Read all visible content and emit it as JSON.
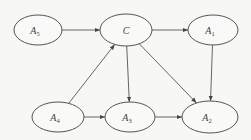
{
  "diagram": {
    "type": "directed-graph",
    "nodes": [
      {
        "id": "A5",
        "base": "A",
        "sub": "5",
        "cx": 38,
        "cy": 30,
        "rx": 24,
        "ry": 15
      },
      {
        "id": "C",
        "base": "C",
        "sub": "",
        "cx": 126,
        "cy": 30,
        "rx": 26,
        "ry": 16
      },
      {
        "id": "A1",
        "base": "A",
        "sub": "1",
        "cx": 213,
        "cy": 30,
        "rx": 25,
        "ry": 15
      },
      {
        "id": "A4",
        "base": "A",
        "sub": "4",
        "cx": 58,
        "cy": 117,
        "rx": 26,
        "ry": 15
      },
      {
        "id": "A3",
        "base": "A",
        "sub": "3",
        "cx": 130,
        "cy": 117,
        "rx": 25,
        "ry": 15
      },
      {
        "id": "A2",
        "base": "A",
        "sub": "2",
        "cx": 210,
        "cy": 117,
        "rx": 28,
        "ry": 16
      }
    ],
    "edges": [
      {
        "from": "A5",
        "to": "C"
      },
      {
        "from": "C",
        "to": "A1"
      },
      {
        "from": "A4",
        "to": "C"
      },
      {
        "from": "C",
        "to": "A3"
      },
      {
        "from": "C",
        "to": "A2"
      },
      {
        "from": "A1",
        "to": "A2"
      },
      {
        "from": "A4",
        "to": "A3"
      },
      {
        "from": "A3",
        "to": "A2"
      }
    ],
    "colors": {
      "stroke": "#555555",
      "background": "#f7f7f5",
      "text": "#444444"
    }
  }
}
